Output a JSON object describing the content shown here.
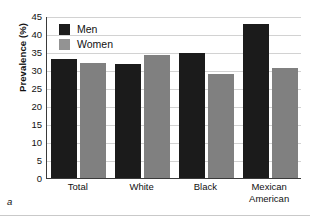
{
  "panel": {
    "letter": "a"
  },
  "chart_data": {
    "type": "bar",
    "title": "",
    "subtitle": "",
    "xlabel": "",
    "ylabel": "Prevalence (%)",
    "ylim": [
      0,
      45
    ],
    "ytick_step": 5,
    "yticks": [
      0,
      5,
      10,
      15,
      20,
      25,
      30,
      35,
      40,
      45
    ],
    "ytick_labels": [
      "0",
      "5",
      "10",
      "15",
      "20",
      "25",
      "30",
      "35",
      "40",
      "45"
    ],
    "grid": "horizontal",
    "legend_position": "top-left",
    "categories": [
      "Total",
      "White",
      "Black",
      "Mexican American"
    ],
    "category_labels": [
      "Total",
      "White",
      "Black",
      "Mexican\nAmerican"
    ],
    "series": [
      {
        "name": "Men",
        "color": "#1b1b1b",
        "values": [
          33.0,
          31.6,
          34.6,
          42.7
        ]
      },
      {
        "name": "Women",
        "color": "#808080",
        "values": [
          32.0,
          34.1,
          28.8,
          30.5
        ]
      }
    ]
  }
}
